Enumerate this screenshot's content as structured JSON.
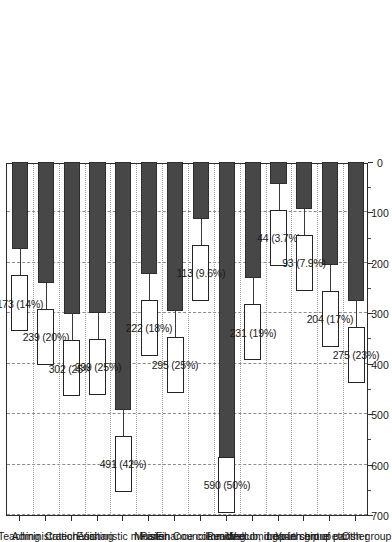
{
  "chart_data": {
    "type": "bar",
    "orientation": "vertical-rotated",
    "title": "",
    "subtitle": "",
    "xlabel": "",
    "ylabel": "",
    "ylim": [
      0,
      700
    ],
    "y_ticks": [
      0,
      100,
      200,
      300,
      400,
      500,
      600,
      700
    ],
    "y_minor_tick_step": 50,
    "grid": "horizontal-dashed-and-category-dotted",
    "legend": "none",
    "bar_color": "#474747",
    "label_box_fill": "#ffffff",
    "label_box_border": "#242424",
    "axis_color": "#2b2b2b",
    "categories": [
      "Teaching",
      "Administration",
      "Catechesis",
      "Visiting",
      "Eucharistic minister",
      "Music",
      "Parish Council",
      "Finance committee",
      "Reading",
      "Welcoming",
      "Lunch club, drop-in centre etc.",
      "Youth group",
      "Leadership of parish group",
      "Other"
    ],
    "values": [
      173,
      239,
      302,
      299,
      491,
      222,
      295,
      113,
      590,
      231,
      44,
      93,
      204,
      275
    ],
    "percents": [
      "14%",
      "20%",
      "25%",
      "25%",
      "42%",
      "18%",
      "25%",
      "9.6%",
      "50%",
      "19%",
      "3.7%",
      "7.9%",
      "17%",
      "23%"
    ],
    "data_labels": [
      "173 (14%)",
      "239 (20%)",
      "302 (25%)",
      "299 (25%)",
      "491 (42%)",
      "222 (18%)",
      "295 (25%)",
      "113 (9.6%)",
      "590 (50%)",
      "231 (19%)",
      "44 (3.7%)",
      "93 (7.9%)",
      "204 (17%)",
      "275 (23%)"
    ],
    "tick_labels": [
      "0",
      "100",
      "200",
      "300",
      "400",
      "500",
      "600",
      "700"
    ]
  }
}
